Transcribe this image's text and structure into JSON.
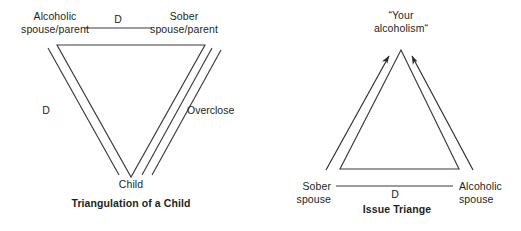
{
  "figure": {
    "background_color": "#ffffff",
    "line_color": "#3a3a3a",
    "text_color": "#231f20"
  },
  "diagrams": [
    {
      "id": "triangulation-of-a-child",
      "caption": "Triangulation of a Child",
      "orientation": "inverted-triangle",
      "nodes": [
        {
          "id": "alcoholic-parent",
          "lines": [
            "Alcoholic",
            "spouse/parent"
          ],
          "position": "top-left"
        },
        {
          "id": "sober-parent",
          "lines": [
            "Sober",
            "spouse/parent"
          ],
          "position": "top-right"
        },
        {
          "id": "child",
          "lines": [
            "Child"
          ],
          "position": "bottom-apex"
        }
      ],
      "edges": [
        {
          "id": "top-edge",
          "label": "D",
          "style": "single-line",
          "from": "alcoholic-parent",
          "to": "sober-parent"
        },
        {
          "id": "left-edge",
          "label": "D",
          "style": "double-line",
          "from": "alcoholic-parent",
          "to": "child"
        },
        {
          "id": "right-edge",
          "label": "Overclose",
          "style": "triple-line",
          "from": "sober-parent",
          "to": "child"
        }
      ]
    },
    {
      "id": "issue-triangle",
      "caption": "Issue Triange",
      "orientation": "upright-triangle",
      "nodes": [
        {
          "id": "your-alcoholism",
          "lines": [
            "“Your",
            "alcoholism“"
          ],
          "position": "top-apex"
        },
        {
          "id": "sober-spouse",
          "lines": [
            "Sober",
            "spouse"
          ],
          "position": "bottom-left"
        },
        {
          "id": "alcoholic-spouse",
          "lines": [
            "Alcoholic",
            "spouse"
          ],
          "position": "bottom-right"
        }
      ],
      "edges": [
        {
          "id": "bottom-edge",
          "label": "D",
          "style": "single-line",
          "from": "sober-spouse",
          "to": "alcoholic-spouse"
        },
        {
          "id": "left-edge",
          "label": "",
          "style": "double-line-with-arrow",
          "from": "sober-spouse",
          "to": "your-alcoholism"
        },
        {
          "id": "right-edge",
          "label": "",
          "style": "double-line-with-arrow",
          "from": "alcoholic-spouse",
          "to": "your-alcoholism"
        }
      ]
    }
  ]
}
